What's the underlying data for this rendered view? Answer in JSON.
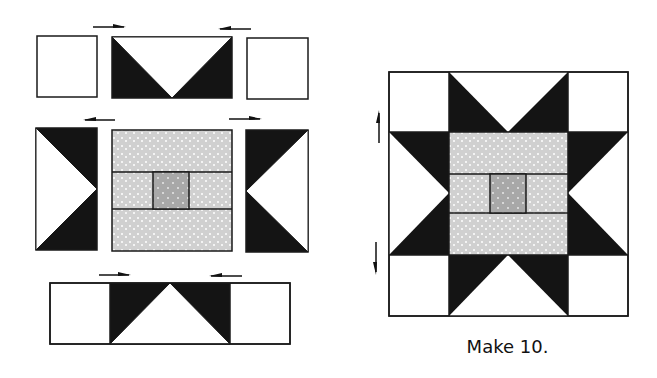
{
  "figure": {
    "type": "quilt block assembly diagram",
    "caption": "Make 10.",
    "colors": {
      "dark_fabric": "#141414",
      "light_print": "#d0d0d0",
      "center_print": "#a8a8a8",
      "background": "#ffffff",
      "outline": "#1a1a1a"
    },
    "assembly_rows": [
      {
        "row": "top",
        "units": [
          "square",
          "flying-geese (point down)",
          "square"
        ],
        "press_arrows": [
          "right",
          "left"
        ]
      },
      {
        "row": "middle",
        "units": [
          "flying-geese (point right)",
          "center unit",
          "flying-geese (point left)"
        ],
        "press_arrows": [
          "left",
          "right"
        ]
      },
      {
        "row": "bottom",
        "units": [
          "square",
          "flying-geese (point up)",
          "square"
        ],
        "press_arrows": [
          "right",
          "left"
        ]
      }
    ],
    "finished_block": {
      "name": "Star block",
      "press_arrows": [
        "up",
        "down"
      ]
    }
  }
}
